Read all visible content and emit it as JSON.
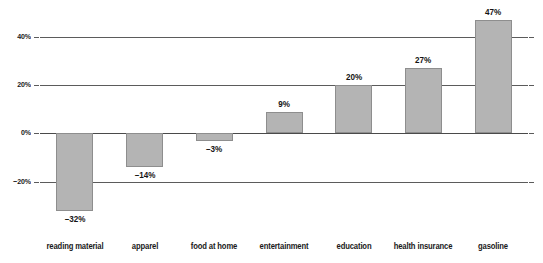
{
  "chart_data": {
    "type": "bar",
    "title": "",
    "subtitle": "",
    "xlabel": "",
    "ylabel": "",
    "categories": [
      "reading material",
      "apparel",
      "food at home",
      "entertainment",
      "education",
      "health insurance",
      "gasoline"
    ],
    "values": [
      -32,
      -14,
      -3,
      9,
      20,
      27,
      47
    ],
    "data_labels": [
      "–32%",
      "–14%",
      "–3%",
      "9%",
      "20%",
      "27%",
      "47%"
    ],
    "ylim": [
      -40,
      52
    ],
    "yticks": [
      40,
      20,
      0,
      -20
    ],
    "ytick_labels": [
      "40%",
      "20%",
      "0%",
      "−20%"
    ],
    "grid": true,
    "gridlines": "horizontal",
    "legend": null,
    "legend_position": "none",
    "bar_color": "#b4b4b4",
    "bar_border_color": "#8e8e8e",
    "gridline_color": "#5b5b5b",
    "zero_line_color": "#4a4a4a",
    "text_color": "#1a1a1a",
    "background_color": "#ffffff"
  }
}
